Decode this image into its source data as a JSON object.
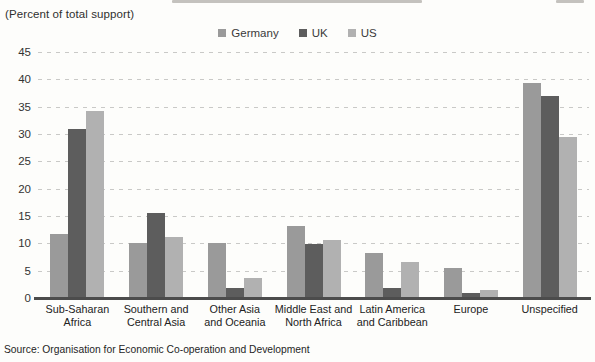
{
  "header": {
    "units_label": "(Percent of total support)"
  },
  "chart_data": {
    "type": "bar",
    "title": "",
    "units_label": "(Percent of total support)",
    "categories": [
      "Sub-Saharan Africa",
      "Southern and Central Asia",
      "Other Asia and Oceania",
      "Middle East and North Africa",
      "Latin America and Caribbean",
      "Europe",
      "Unspecified"
    ],
    "category_display": [
      "Sub-Saharan\nAfrica",
      "Southern and\nCentral Asia",
      "Other Asia\nand Oceania",
      "Middle East and\nNorth Africa",
      "Latin America\nand Caribbean",
      "Europe",
      "Unspecified"
    ],
    "series": [
      {
        "name": "Germany",
        "color": "#9a9a9a",
        "values": [
          11.8,
          10.0,
          10.0,
          13.1,
          8.3,
          5.4,
          39.4
        ]
      },
      {
        "name": "UK",
        "color": "#5d5d5d",
        "values": [
          31.0,
          15.5,
          1.8,
          9.9,
          1.8,
          1.0,
          36.9
        ]
      },
      {
        "name": "US",
        "color": "#b1b1b1",
        "values": [
          34.2,
          11.2,
          3.6,
          10.6,
          6.6,
          1.4,
          29.5
        ]
      }
    ],
    "ylim": [
      0,
      45
    ],
    "yticks": [
      0,
      5,
      10,
      15,
      20,
      25,
      30,
      35,
      40,
      45
    ],
    "grid": "horizontal dashed",
    "legend_position": "top center"
  },
  "footer": {
    "source": "Source: Organisation for Economic Co-operation and Development"
  }
}
